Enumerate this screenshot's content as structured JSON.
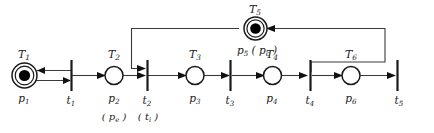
{
  "diagram": {
    "kind": "petri-net",
    "background_color": "#ffffff",
    "line_color": "#3a3a3a",
    "token_color": "#000000",
    "places": [
      {
        "id": "p1",
        "top_label": "T",
        "top_sub": "1",
        "name_label": "p",
        "name_sub": "1",
        "alt_label": "",
        "alt_sub": "",
        "tokens": 1,
        "double_ring": true
      },
      {
        "id": "p2",
        "top_label": "T",
        "top_sub": "2",
        "name_label": "p",
        "name_sub": "2",
        "alt_label": "( p",
        "alt_sub": "e",
        "alt_tail": " )",
        "tokens": 0,
        "double_ring": false
      },
      {
        "id": "p3",
        "top_label": "T",
        "top_sub": "3",
        "name_label": "p",
        "name_sub": "3",
        "alt_label": "",
        "alt_sub": "",
        "tokens": 0,
        "double_ring": false
      },
      {
        "id": "p4",
        "top_label": "T",
        "top_sub": "4",
        "name_label": "p",
        "name_sub": "4",
        "alt_label": "",
        "alt_sub": "",
        "tokens": 0,
        "double_ring": false
      },
      {
        "id": "p5",
        "top_label": "T",
        "top_sub": "5",
        "name_label": "p",
        "name_sub": "5",
        "alt_label": " ( p",
        "alt_sub": "c",
        "alt_tail": " )",
        "tokens": 1,
        "double_ring": true
      },
      {
        "id": "p6",
        "top_label": "T",
        "top_sub": "6",
        "name_label": "p",
        "name_sub": "6",
        "alt_label": "",
        "alt_sub": "",
        "tokens": 0,
        "double_ring": false
      }
    ],
    "transitions": [
      {
        "id": "t1",
        "name_label": "t",
        "name_sub": "1",
        "alt_label": "",
        "alt_sub": ""
      },
      {
        "id": "t2",
        "name_label": "t",
        "name_sub": "2",
        "alt_label": "( t",
        "alt_sub": "i",
        "alt_tail": " )"
      },
      {
        "id": "t3",
        "name_label": "t",
        "name_sub": "3",
        "alt_label": "",
        "alt_sub": ""
      },
      {
        "id": "t4",
        "name_label": "t",
        "name_sub": "4",
        "alt_label": "",
        "alt_sub": ""
      },
      {
        "id": "t5",
        "name_label": "t",
        "name_sub": "5",
        "alt_label": "",
        "alt_sub": ""
      }
    ],
    "arcs": [
      {
        "from": "p1",
        "to": "t1",
        "style": "straight"
      },
      {
        "from": "t1",
        "to": "p1",
        "style": "straight"
      },
      {
        "from": "t1",
        "to": "p2",
        "style": "straight"
      },
      {
        "from": "p2",
        "to": "t2",
        "style": "straight"
      },
      {
        "from": "p5",
        "to": "t2",
        "style": "routed-top-left"
      },
      {
        "from": "t2",
        "to": "p3",
        "style": "straight"
      },
      {
        "from": "p3",
        "to": "t3",
        "style": "straight"
      },
      {
        "from": "t3",
        "to": "p4",
        "style": "straight"
      },
      {
        "from": "p4",
        "to": "t4",
        "style": "straight"
      },
      {
        "from": "t4",
        "to": "p5",
        "style": "routed-top-right"
      },
      {
        "from": "t4",
        "to": "p6",
        "style": "straight"
      },
      {
        "from": "p6",
        "to": "t5",
        "style": "straight"
      }
    ]
  }
}
